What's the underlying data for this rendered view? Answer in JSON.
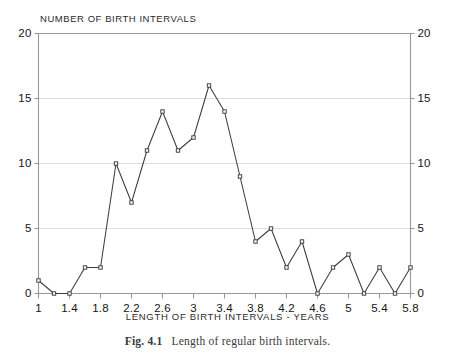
{
  "chart_data": {
    "type": "line",
    "title": "NUMBER OF BIRTH INTERVALS",
    "xlabel": "LENGTH OF BIRTH INTERVALS - YEARS",
    "ylabel": "",
    "xlim": [
      1,
      5.8
    ],
    "ylim": [
      0,
      20
    ],
    "grid": true,
    "legend": null,
    "marker": "square",
    "x": [
      1.0,
      1.2,
      1.4,
      1.6,
      1.8,
      2.0,
      2.2,
      2.4,
      2.6,
      2.8,
      3.0,
      3.2,
      3.4,
      3.6,
      3.8,
      4.0,
      4.2,
      4.4,
      4.6,
      4.8,
      5.0,
      5.2,
      5.4,
      5.6,
      5.8
    ],
    "values": [
      1,
      0,
      0,
      2,
      2,
      10,
      7,
      11,
      14,
      11,
      12,
      16,
      14,
      9,
      4,
      5,
      2,
      4,
      0,
      2,
      3,
      0,
      2,
      0,
      2
    ],
    "xticks": [
      1,
      1.4,
      1.8,
      2.2,
      2.6,
      3,
      3.4,
      3.8,
      4.2,
      4.6,
      5,
      5.4,
      5.8
    ],
    "xticklabels": [
      "1",
      "1.4",
      "1.8",
      "2.2",
      "2.6",
      "3",
      "3.4",
      "3.8",
      "4.2",
      "4.6",
      "5",
      "5.4",
      "5.8"
    ],
    "yticks": [
      0,
      5,
      10,
      15,
      20
    ],
    "yticklabels": [
      "0",
      "5",
      "10",
      "15",
      "20"
    ],
    "yticklabels_right": [
      "0",
      "5",
      "10",
      "15",
      "20"
    ],
    "line_color": "#3c3c3c",
    "grid_color": "#dcdcdc",
    "axis_color": "#999999"
  },
  "caption": {
    "figure_number": "Fig. 4.1",
    "text": "Length of regular birth intervals."
  }
}
